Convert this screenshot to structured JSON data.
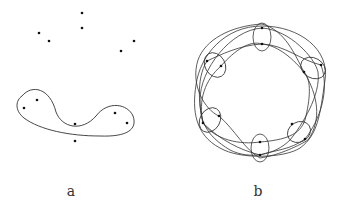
{
  "panels": [
    {
      "label": "a",
      "label_pos": [
        71,
        197
      ],
      "points": [
        [
          82,
          13
        ],
        [
          82,
          28
        ],
        [
          39,
          33
        ],
        [
          49,
          41
        ],
        [
          134,
          41
        ],
        [
          121,
          51
        ],
        [
          37,
          100
        ],
        [
          24,
          108
        ],
        [
          75,
          124
        ],
        [
          115,
          113
        ],
        [
          127,
          123
        ],
        [
          75,
          141
        ]
      ],
      "curves": [
        "M 22 96 C 32 84, 50 88, 56 112 C 62 128, 82 132, 96 116 C 108 100, 128 104, 133 116 C 138 130, 126 137, 100 136 C 70 136, 40 130, 24 118 C 14 110, 16 100, 22 96 Z"
      ]
    },
    {
      "label": "b",
      "label_pos": [
        258,
        197
      ],
      "points": [
        [
          262,
          28
        ],
        [
          262,
          44
        ],
        [
          207,
          61
        ],
        [
          221,
          66
        ],
        [
          304,
          72
        ],
        [
          321,
          65
        ],
        [
          203,
          123
        ],
        [
          219,
          116
        ],
        [
          292,
          124
        ],
        [
          305,
          139
        ],
        [
          260,
          142
        ],
        [
          260,
          155
        ]
      ],
      "ellipses": [
        {
          "cx": 262,
          "cy": 37,
          "rx": 9,
          "ry": 14,
          "rot": 0
        },
        {
          "cx": 215,
          "cy": 65,
          "rx": 10,
          "ry": 13,
          "rot": -30
        },
        {
          "cx": 313,
          "cy": 68,
          "rx": 13,
          "ry": 10,
          "rot": 30
        },
        {
          "cx": 210,
          "cy": 120,
          "rx": 10,
          "ry": 13,
          "rot": 30
        },
        {
          "cx": 299,
          "cy": 132,
          "rx": 12,
          "ry": 10,
          "rot": -30
        },
        {
          "cx": 260,
          "cy": 148,
          "rx": 9,
          "ry": 14,
          "rot": 0
        }
      ],
      "loops": [
        "M 262 26 C 300 26, 330 50, 325 80 C 320 115, 318 135, 300 148 C 285 158, 240 160, 220 148 C 195 135, 192 110, 196 85 C 200 55, 225 26, 262 26 Z",
        "M 262 28 C 290 30, 315 58, 318 72 C 321 95, 302 125, 290 140 C 275 155, 250 160, 230 150 C 205 135, 200 120, 200 100 C 200 70, 230 30, 262 28 Z",
        "M 262 44 C 240 45, 220 55, 207 61 C 195 80, 200 110, 203 123 C 215 140, 240 145, 260 142 C 285 140, 300 135, 305 120 C 310 100, 312 80, 304 72 C 290 55, 275 45, 262 44 Z",
        "M 262 24 C 230 26, 205 40, 198 60 C 190 85, 205 110, 219 116 C 235 130, 245 150, 260 158 C 280 155, 300 145, 308 140 C 322 120, 318 95, 304 72 C 295 55, 285 30, 262 24 Z",
        "M 221 66 C 235 50, 250 40, 262 44 C 285 45, 300 60, 321 65 C 330 90, 320 120, 305 139 C 290 150, 275 150, 260 155 C 240 150, 220 140, 203 123 C 198 100, 205 80, 221 66 Z"
      ]
    }
  ],
  "style": {
    "stroke": "#333333",
    "dot": "#111111"
  }
}
